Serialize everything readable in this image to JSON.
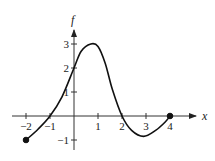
{
  "chart_data": {
    "type": "line",
    "title": "",
    "xlabel": "x",
    "ylabel": "f",
    "xlim": [
      -2.2,
      4.9
    ],
    "ylim": [
      -1.4,
      3.6
    ],
    "grid": false,
    "legend": null,
    "x_ticks": [
      -2,
      -1,
      1,
      2,
      3,
      4
    ],
    "x_tick_labels": [
      "−2",
      "−1",
      "1",
      "2",
      "3",
      "4"
    ],
    "y_ticks": [
      -1,
      1,
      2,
      3
    ],
    "y_tick_labels": [
      "−1",
      "1",
      "2",
      "3"
    ],
    "series": [
      {
        "name": "f",
        "x": [
          -2,
          -1.5,
          -1,
          -0.5,
          0,
          0.3,
          0.7,
          1.0,
          1.3,
          1.6,
          2,
          2.4,
          2.9,
          3.4,
          3.8,
          4
        ],
        "y": [
          -1,
          -0.55,
          0,
          0.8,
          2,
          2.7,
          3,
          2.9,
          2.2,
          1.1,
          0,
          -0.6,
          -0.85,
          -0.6,
          -0.25,
          0
        ]
      }
    ],
    "endpoints": [
      {
        "x": -2,
        "y": -1,
        "filled": true
      },
      {
        "x": 4,
        "y": 0,
        "filled": true
      }
    ]
  },
  "labels": {
    "x_axis": "x",
    "y_axis": "f"
  }
}
